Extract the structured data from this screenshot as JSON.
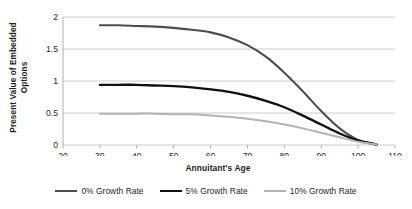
{
  "chart_data": {
    "type": "line",
    "title": "",
    "xlabel": "Annuitant's Age",
    "ylabel": "Present Value of Embedded Options",
    "ylabel_line1": "Present Value of Embedded",
    "ylabel_line2": "Options",
    "xlim": [
      20,
      110
    ],
    "ylim": [
      0,
      2
    ],
    "xticks": [
      20,
      30,
      40,
      50,
      60,
      70,
      80,
      90,
      100,
      110
    ],
    "yticks": [
      0,
      0.5,
      1,
      1.5,
      2
    ],
    "xtick_labels": [
      "20",
      "30",
      "40",
      "50",
      "60",
      "70",
      "80",
      "90",
      "100",
      "110"
    ],
    "ytick_labels": [
      "0",
      "0.5",
      "1",
      "1.5",
      "2"
    ],
    "grid": "horizontal",
    "legend_position": "bottom",
    "x": [
      30,
      35,
      40,
      45,
      50,
      55,
      60,
      65,
      70,
      75,
      80,
      85,
      90,
      95,
      100,
      105
    ],
    "series": [
      {
        "name": "0% Growth Rate",
        "color": "#4d4d4d",
        "width": 2.1,
        "values": [
          1.87,
          1.87,
          1.86,
          1.85,
          1.83,
          1.8,
          1.76,
          1.68,
          1.56,
          1.38,
          1.13,
          0.84,
          0.53,
          0.26,
          0.08,
          0.01
        ]
      },
      {
        "name": "5% Growth Rate",
        "color": "#111111",
        "width": 2.4,
        "values": [
          0.94,
          0.94,
          0.94,
          0.93,
          0.92,
          0.9,
          0.87,
          0.83,
          0.77,
          0.69,
          0.59,
          0.46,
          0.32,
          0.18,
          0.07,
          0.01
        ]
      },
      {
        "name": "10% Growth Rate",
        "color": "#b3b3b3",
        "width": 2.0,
        "values": [
          0.49,
          0.49,
          0.49,
          0.49,
          0.48,
          0.48,
          0.46,
          0.44,
          0.41,
          0.37,
          0.32,
          0.26,
          0.19,
          0.12,
          0.05,
          0.01
        ]
      }
    ],
    "legend": [
      {
        "label": "0% Growth Rate",
        "color": "#4d4d4d",
        "width": 2.1
      },
      {
        "label": "5% Growth Rate",
        "color": "#111111",
        "width": 2.6
      },
      {
        "label": "10% Growth Rate",
        "color": "#b3b3b3",
        "width": 2.0
      }
    ],
    "axis_color": "#a6a6a6",
    "grid_color": "#bfbfbf",
    "tick_label_color": "#231f20"
  }
}
